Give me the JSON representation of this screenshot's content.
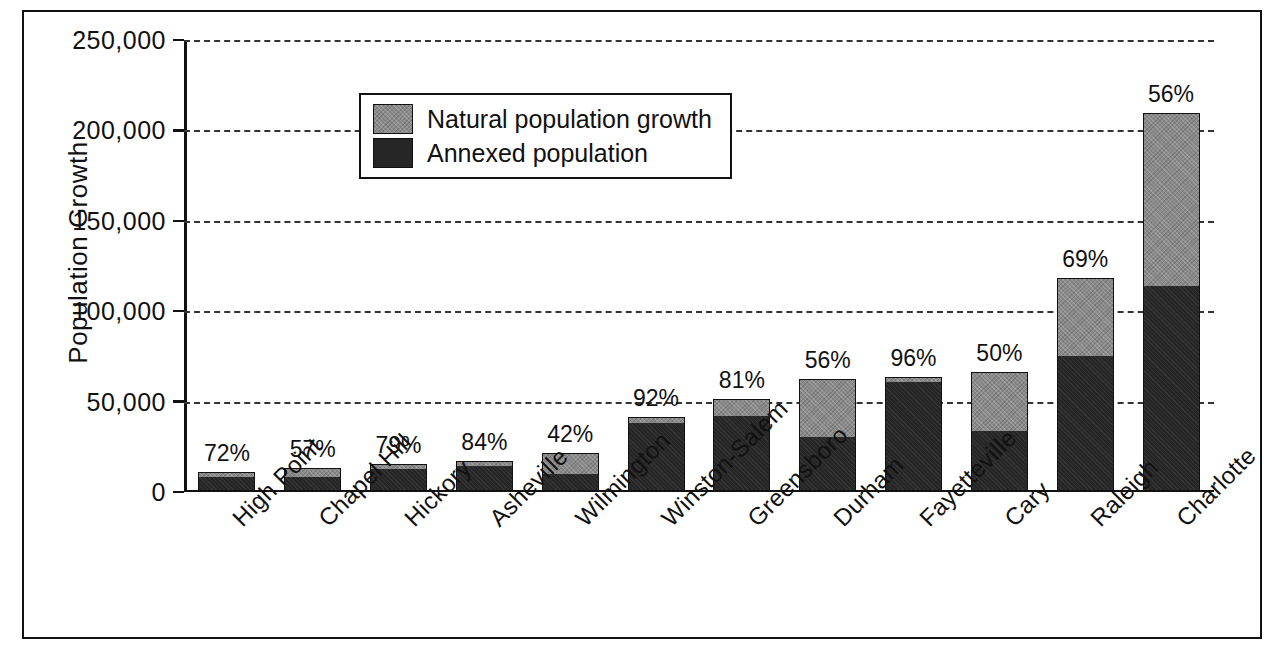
{
  "chart_data": {
    "type": "bar",
    "subtype": "stacked-bar",
    "title": "",
    "xlabel": "",
    "ylabel": "Population Growth",
    "ylim": [
      0,
      250000
    ],
    "ytick_values": [
      0,
      50000,
      100000,
      150000,
      200000,
      250000
    ],
    "ytick_labels": [
      "0",
      "50,000",
      "100,000",
      "150,000",
      "200,000",
      "250,000"
    ],
    "grid": true,
    "grid_style": "dashed-horizontal",
    "legend_position": "upper-left-inside",
    "categories": [
      "High Point",
      "Chapel Hill",
      "Hickory",
      "Asheville",
      "Wilmington",
      "Winston-Salem",
      "Greensboro",
      "Durham",
      "Fayetteville",
      "Cary",
      "Raleigh",
      "Charlotte"
    ],
    "series": [
      {
        "name": "Annexed population",
        "color": "#262626",
        "values": [
          6900,
          6900,
          11100,
          13000,
          8400,
          36800,
          40500,
          29100,
          59500,
          32500,
          74000,
          112300
        ]
      },
      {
        "name": "Natural population growth",
        "color": "#8a8a8a",
        "values": [
          2700,
          5200,
          2900,
          2500,
          11600,
          3200,
          9500,
          22900,
          2500,
          32500,
          33200,
          96200
        ]
      }
    ],
    "totals": [
      9600,
      12100,
      14000,
      15500,
      20000,
      40000,
      50000,
      52000,
      62000,
      65000,
      107200,
      208500
    ],
    "annotations": {
      "description": "Percent of growth from annexation, shown above each bar",
      "values": [
        "72%",
        "57%",
        "79%",
        "84%",
        "42%",
        "92%",
        "81%",
        "56%",
        "96%",
        "50%",
        "69%",
        "56%"
      ]
    },
    "bars": [
      {
        "category": "High Point",
        "annexed": 6900,
        "natural": 2700,
        "total": 9600,
        "pct_label": "72%"
      },
      {
        "category": "Chapel Hill",
        "annexed": 6900,
        "natural": 5200,
        "total": 12100,
        "pct_label": "57%"
      },
      {
        "category": "Hickory",
        "annexed": 11100,
        "natural": 2900,
        "total": 14000,
        "pct_label": "79%"
      },
      {
        "category": "Asheville",
        "annexed": 13000,
        "natural": 2500,
        "total": 15500,
        "pct_label": "84%"
      },
      {
        "category": "Wilmington",
        "annexed": 8400,
        "natural": 11600,
        "total": 20000,
        "pct_label": "42%"
      },
      {
        "category": "Winston-Salem",
        "annexed": 36800,
        "natural": 3200,
        "total": 40000,
        "pct_label": "92%"
      },
      {
        "category": "Greensboro",
        "annexed": 40500,
        "natural": 9500,
        "total": 50000,
        "pct_label": "81%"
      },
      {
        "category": "Durham",
        "annexed": 29100,
        "natural": 31900,
        "total": 61000,
        "pct_label": "56%"
      },
      {
        "category": "Fayetteville",
        "annexed": 59500,
        "natural": 2500,
        "total": 62000,
        "pct_label": "96%"
      },
      {
        "category": "Cary",
        "annexed": 32500,
        "natural": 32500,
        "total": 65000,
        "pct_label": "50%"
      },
      {
        "category": "Raleigh",
        "annexed": 74000,
        "natural": 43200,
        "total": 117200,
        "pct_label": "69%"
      },
      {
        "category": "Charlotte",
        "annexed": 112300,
        "natural": 96200,
        "total": 208500,
        "pct_label": "56%"
      }
    ]
  },
  "legend": {
    "items": [
      {
        "label": "Natural population growth",
        "key": "natural"
      },
      {
        "label": "Annexed population",
        "key": "annexed"
      }
    ]
  }
}
